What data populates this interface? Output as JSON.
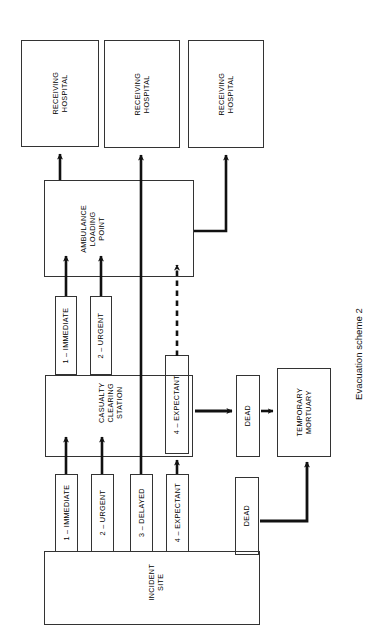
{
  "figure": {
    "caption": "Evacuation scheme 2",
    "orientation": "rotated-90-ccw",
    "line_color": "#333333",
    "background": "#ffffff"
  },
  "nodes": {
    "hospital_1": {
      "label": "RECEIVING\nHOSPITAL",
      "line1": "RECEIVING",
      "line2": "HOSPITAL"
    },
    "hospital_2": {
      "label": "RECEIVING\nHOSPITAL",
      "line1": "RECEIVING",
      "line2": "HOSPITAL"
    },
    "hospital_3": {
      "label": "RECEIVING\nHOSPITAL",
      "line1": "RECEIVING",
      "line2": "HOSPITAL"
    },
    "ambulance_loading_point": {
      "line1": "AMBULANCE",
      "line2": "LOADING",
      "line3": "POINT"
    },
    "casualty_clearing_station": {
      "line1": "CASUALTY",
      "line2": "CLEARING",
      "line3": "STATION"
    },
    "incident_site": {
      "line1": "INCIDENT",
      "line2": "SITE"
    },
    "ccs_immediate": {
      "label": "1 – IMMEDIATE"
    },
    "ccs_urgent": {
      "label": "2 – URGENT"
    },
    "ccs_expectant": {
      "label": "4 – EXPECTANT"
    },
    "site_immediate": {
      "label": "1 – IMMEDIATE"
    },
    "site_urgent": {
      "label": "2 – URGENT"
    },
    "site_delayed": {
      "label": "3 – DELAYED"
    },
    "site_expectant": {
      "label": "4 – EXPECTANT"
    },
    "dead_ccs": {
      "label": "DEAD"
    },
    "dead_site": {
      "label": "DEAD"
    },
    "temporary_mortuary": {
      "line1": "TEMPORARY",
      "line2": "MORTUARY"
    }
  },
  "edges": [
    {
      "id": "alp-to-hospital1",
      "from": "ambulance_loading_point",
      "to": "hospital_1",
      "style": "solid"
    },
    {
      "id": "delayed-to-hospital2",
      "from": "site_delayed",
      "to": "hospital_2",
      "style": "solid"
    },
    {
      "id": "alp-to-hospital3",
      "from": "ambulance_loading_point",
      "to": "hospital_3",
      "style": "solid"
    },
    {
      "id": "ccs-immediate-to-alp",
      "from": "ccs_immediate",
      "to": "ambulance_loading_point",
      "style": "solid"
    },
    {
      "id": "ccs-urgent-to-alp",
      "from": "ccs_urgent",
      "to": "ambulance_loading_point",
      "style": "solid"
    },
    {
      "id": "ccs-expectant-to-alp",
      "from": "ccs_expectant",
      "to": "ambulance_loading_point",
      "style": "dashed"
    },
    {
      "id": "site-immediate-to-ccs",
      "from": "site_immediate",
      "to": "ccs_immediate",
      "style": "solid"
    },
    {
      "id": "site-urgent-to-ccs",
      "from": "site_urgent",
      "to": "ccs_urgent",
      "style": "solid"
    },
    {
      "id": "site-expectant-to-ccs",
      "from": "site_expectant",
      "to": "ccs_expectant",
      "style": "solid"
    },
    {
      "id": "ccs-expectant-to-dead",
      "from": "ccs_expectant",
      "to": "dead_ccs",
      "style": "solid"
    },
    {
      "id": "dead-to-mortuary",
      "from": "dead_ccs",
      "to": "temporary_mortuary",
      "style": "solid"
    },
    {
      "id": "site-dead-to-mortuary",
      "from": "dead_site",
      "to": "temporary_mortuary",
      "style": "solid"
    }
  ]
}
